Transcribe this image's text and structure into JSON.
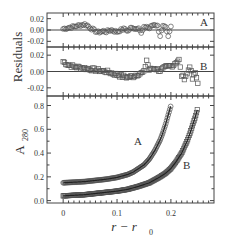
{
  "chart_data": [
    {
      "type": "scatter",
      "panel": "residuals-A",
      "title": "",
      "ylabel": "Residuals",
      "label": "A",
      "xlim": [
        -0.03,
        0.28
      ],
      "ylim": [
        -0.03,
        0.03
      ],
      "yticks": [
        0.02,
        0.0,
        -0.02
      ],
      "ytick_labels": [
        "0.02",
        "0.00",
        "-0.02"
      ],
      "marker": "circle",
      "zero_line": true,
      "x": [
        0.0,
        0.005,
        0.01,
        0.015,
        0.02,
        0.025,
        0.03,
        0.035,
        0.04,
        0.045,
        0.05,
        0.055,
        0.06,
        0.065,
        0.07,
        0.075,
        0.08,
        0.085,
        0.09,
        0.095,
        0.1,
        0.105,
        0.11,
        0.115,
        0.12,
        0.125,
        0.13,
        0.135,
        0.14,
        0.145,
        0.15,
        0.155,
        0.16,
        0.165,
        0.17,
        0.175,
        0.18,
        0.185,
        0.19,
        0.195,
        0.2
      ],
      "values": [
        0.002,
        0.003,
        0.004,
        0.005,
        0.006,
        0.007,
        0.008,
        0.009,
        0.01,
        0.008,
        0.004,
        0.001,
        -0.002,
        -0.004,
        -0.003,
        -0.002,
        -0.003,
        -0.001,
        0.0,
        -0.002,
        -0.003,
        -0.001,
        0.001,
        0.002,
        -0.002,
        0.003,
        0.004,
        0.002,
        0.005,
        -0.006,
        0.004,
        0.006,
        0.003,
        0.008,
        0.01,
        0.007,
        -0.01,
        0.006,
        0.004,
        -0.012,
        0.006
      ]
    },
    {
      "type": "scatter",
      "panel": "residuals-B",
      "ylabel": "Residuals",
      "label": "B",
      "xlim": [
        -0.03,
        0.28
      ],
      "ylim": [
        -0.03,
        0.03
      ],
      "yticks": [
        0.02,
        0.0,
        -0.02
      ],
      "ytick_labels": [
        "0.02",
        "0.00",
        "-0.02"
      ],
      "marker": "square",
      "zero_line": true,
      "x": [
        0.0,
        0.01,
        0.02,
        0.03,
        0.04,
        0.05,
        0.06,
        0.07,
        0.08,
        0.09,
        0.1,
        0.11,
        0.12,
        0.13,
        0.14,
        0.15,
        0.155,
        0.16,
        0.17,
        0.18,
        0.19,
        0.2,
        0.205,
        0.21,
        0.215,
        0.22,
        0.225,
        0.23,
        0.235,
        0.24,
        0.245,
        0.25
      ],
      "values": [
        0.012,
        0.008,
        0.006,
        0.005,
        0.004,
        0.003,
        0.002,
        0.001,
        0.0,
        -0.002,
        -0.004,
        -0.006,
        -0.007,
        -0.006,
        -0.003,
        -0.001,
        0.014,
        0.002,
        0.004,
        0.001,
        0.005,
        0.007,
        0.008,
        0.012,
        0.014,
        -0.005,
        -0.008,
        -0.003,
        0.007,
        -0.009,
        -0.002,
        -0.013
      ]
    },
    {
      "type": "scatter",
      "panel": "absorbance",
      "title": "",
      "xlabel": "r − r0",
      "ylabel": "A280",
      "xlim": [
        -0.03,
        0.28
      ],
      "ylim": [
        -0.02,
        0.88
      ],
      "xticks": [
        0,
        0.1,
        0.2
      ],
      "xtick_labels": [
        "0",
        "0.1",
        "0.2"
      ],
      "yticks": [
        0.0,
        0.2,
        0.4,
        0.6,
        0.8
      ],
      "ytick_labels": [
        "0.0",
        "0.2",
        "0.4",
        "0.6",
        "0.8"
      ],
      "grid": false,
      "series": [
        {
          "name": "A",
          "marker": "circle",
          "x": [
            0.0,
            0.02,
            0.04,
            0.06,
            0.08,
            0.1,
            0.12,
            0.13,
            0.14,
            0.15,
            0.16,
            0.17,
            0.18,
            0.185,
            0.19,
            0.195,
            0.2
          ],
          "values": [
            0.15,
            0.155,
            0.16,
            0.17,
            0.18,
            0.195,
            0.22,
            0.24,
            0.27,
            0.3,
            0.35,
            0.42,
            0.51,
            0.57,
            0.64,
            0.72,
            0.8
          ]
        },
        {
          "name": "B",
          "marker": "square",
          "x": [
            0.0,
            0.02,
            0.04,
            0.06,
            0.08,
            0.1,
            0.12,
            0.14,
            0.16,
            0.18,
            0.19,
            0.2,
            0.21,
            0.22,
            0.23,
            0.235,
            0.24,
            0.245,
            0.25
          ],
          "values": [
            0.04,
            0.045,
            0.05,
            0.06,
            0.07,
            0.08,
            0.095,
            0.12,
            0.15,
            0.2,
            0.23,
            0.27,
            0.33,
            0.4,
            0.5,
            0.56,
            0.63,
            0.7,
            0.78
          ]
        }
      ],
      "annotations": [
        {
          "text": "A",
          "x": 0.15,
          "y": 0.52
        },
        {
          "text": "B",
          "x": 0.232,
          "y": 0.3
        }
      ]
    }
  ],
  "labels": {
    "residuals_axis": "Residuals",
    "a280_main": "A",
    "a280_sub": "280",
    "x_axis_main": "r − r",
    "x_axis_sub": "0",
    "panel_a_tag": "A",
    "panel_b_tag": "B",
    "curve_a_tag": "A",
    "curve_b_tag": "B"
  },
  "colors": {
    "axis": "#444444",
    "marker": "#555555",
    "text": "#333333"
  }
}
